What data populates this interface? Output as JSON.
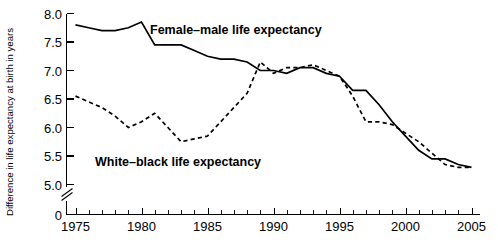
{
  "chart_data": {
    "type": "line",
    "title": "",
    "xlabel": "",
    "ylabel": "Difference in life expectancy at birth in years",
    "xlim": [
      1975,
      2005
    ],
    "ylim": [
      5.0,
      8.0
    ],
    "grid": false,
    "legend_position": "inline-annotations",
    "y_axis_break": true,
    "y_break_label": "0",
    "xticks": [
      1975,
      1980,
      1985,
      1990,
      1995,
      2000,
      2005
    ],
    "xtick_labels": [
      "1975",
      "1980",
      "1985",
      "1990",
      "1995",
      "2000",
      "2005"
    ],
    "x_minor_tick_step": 1,
    "yticks": [
      5.0,
      5.5,
      6.0,
      6.5,
      7.0,
      7.5,
      8.0
    ],
    "ytick_labels": [
      "5.0",
      "5.5",
      "6.0",
      "6.5",
      "7.0",
      "7.5",
      "8.0"
    ],
    "x": [
      1975,
      1976,
      1977,
      1978,
      1979,
      1980,
      1981,
      1982,
      1983,
      1984,
      1985,
      1986,
      1987,
      1988,
      1989,
      1990,
      1991,
      1992,
      1993,
      1994,
      1995,
      1996,
      1997,
      1998,
      1999,
      2000,
      2001,
      2002,
      2003,
      2004,
      2005
    ],
    "series": [
      {
        "name": "Female–male life expectancy",
        "style": "solid",
        "color": "#000000",
        "label_text": "Female–male life expectancy",
        "values": [
          7.8,
          7.75,
          7.7,
          7.7,
          7.75,
          7.85,
          7.45,
          7.45,
          7.45,
          7.35,
          7.25,
          7.2,
          7.2,
          7.15,
          7.0,
          7.0,
          6.95,
          7.05,
          7.05,
          6.95,
          6.9,
          6.65,
          6.65,
          6.4,
          6.1,
          5.85,
          5.6,
          5.45,
          5.45,
          5.35,
          5.3
        ]
      },
      {
        "name": "White–black life expectancy",
        "style": "dashed",
        "color": "#000000",
        "label_text": "White–black life expectancy",
        "values": [
          6.55,
          6.45,
          6.35,
          6.2,
          6.0,
          6.1,
          6.25,
          6.0,
          5.75,
          5.8,
          5.85,
          6.1,
          6.35,
          6.6,
          7.15,
          6.95,
          7.05,
          7.05,
          7.1,
          7.0,
          6.9,
          6.55,
          6.1,
          6.1,
          6.05,
          5.9,
          5.75,
          5.55,
          5.35,
          5.3,
          5.3
        ]
      }
    ],
    "annotations": [
      {
        "name": "female-male-label",
        "text": "Female–male life expectancy",
        "x_px": 150,
        "y_px": 34
      },
      {
        "name": "white-black-label",
        "text": "White–black life expectancy",
        "x_px": 95,
        "y_px": 166
      }
    ]
  }
}
